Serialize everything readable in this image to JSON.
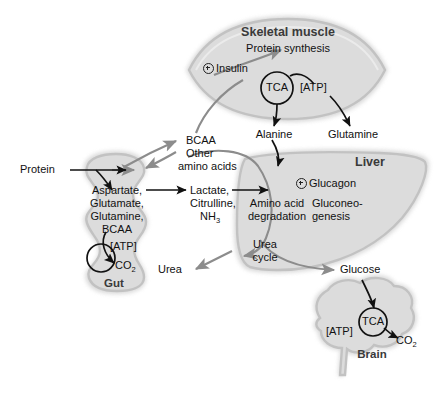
{
  "figure": {
    "type": "metabolic-pathway-diagram",
    "palette": {
      "organ_fill": "#dcdcdc",
      "organ_edge": "#bdbdbd",
      "organ_halo": "#d4d4d4",
      "black_arrow": "#111111",
      "gray_arrow": "#8c8c8c",
      "organ_label": "#3a3a3a",
      "text": "#111111",
      "background": "#ffffff"
    }
  },
  "organs": [
    {
      "id": "skeletal-muscle",
      "label": "Skeletal muscle",
      "shape": "spindle"
    },
    {
      "id": "gut",
      "label": "Gut",
      "shape": "wavy-tube"
    },
    {
      "id": "liver",
      "label": "Liver",
      "shape": "wedge"
    },
    {
      "id": "brain",
      "label": "Brain",
      "shape": "brain-silhouette"
    }
  ],
  "skeletal_muscle": {
    "title": "Skeletal muscle",
    "process": "Protein synthesis",
    "hormone": "Insulin",
    "hormone_effect": "+",
    "cycle": "TCA",
    "energy": "[ATP]",
    "outputs": [
      "Alanine",
      "Glutamine"
    ]
  },
  "gut": {
    "title": "Gut",
    "input": "Protein",
    "metabolites": [
      "Aspartate,",
      "Glutamate,",
      "Glutamine,",
      "BCAA"
    ],
    "energy": "[ATP]",
    "waste": "CO",
    "waste_sub": "2",
    "outputs": [
      "Lactate,",
      "Citrulline,",
      "NH"
    ],
    "outputs_sub": "3"
  },
  "liver": {
    "title": "Liver",
    "hormone": "Glucagon",
    "hormone_effect": "+",
    "processes": [
      "Amino acid degradation",
      "Gluconeo-genesis",
      "Urea cycle"
    ],
    "process_lines": {
      "degradation": [
        "Amino acid",
        "degradation"
      ],
      "gluconeogenesis": [
        "Gluconeo-",
        "genesis"
      ],
      "urea": [
        "Urea",
        "cycle"
      ]
    },
    "waste_output": "Urea",
    "product_output": "Glucose"
  },
  "brain": {
    "title": "Brain",
    "cycle": "TCA",
    "energy": "[ATP]",
    "waste": "CO",
    "waste_sub": "2",
    "input": "Glucose"
  },
  "shared_pool": {
    "lines": [
      "BCAA",
      "Other",
      "amino acids"
    ]
  },
  "edges": [
    {
      "from": "Protein",
      "to": "gut",
      "color": "black"
    },
    {
      "from": "Protein",
      "to": "Aspartate/Glutamate/Glutamine/BCAA",
      "color": "black"
    },
    {
      "from": "gut-metabolites",
      "to": "Lactate/Citrulline/NH3",
      "color": "black"
    },
    {
      "from": "gut-TCA",
      "to": "CO2",
      "color": "black"
    },
    {
      "from": "gut",
      "to": "BCAA/Other amino acids",
      "color": "gray",
      "bidirectional": true
    },
    {
      "from": "BCAA/Other amino acids",
      "to": "skeletal-muscle",
      "color": "gray"
    },
    {
      "from": "skeletal-muscle-TCA",
      "to": "Alanine",
      "color": "black"
    },
    {
      "from": "skeletal-muscle-ATP",
      "to": "Glutamine",
      "color": "black"
    },
    {
      "from": "Alanine",
      "to": "liver",
      "color": "black"
    },
    {
      "from": "Lactate/Citrulline/NH3",
      "to": "liver",
      "color": "black"
    },
    {
      "from": "liver-amino-acid-degradation",
      "to": "Urea cycle",
      "color": "gray"
    },
    {
      "from": "Urea cycle",
      "to": "Urea",
      "color": "gray"
    },
    {
      "from": "liver-gluconeogenesis",
      "to": "Glucose",
      "color": "gray"
    },
    {
      "from": "Glucose",
      "to": "brain-TCA",
      "color": "black"
    },
    {
      "from": "brain-TCA",
      "to": "CO2",
      "color": "black"
    },
    {
      "from": "Insulin",
      "to": "Protein synthesis",
      "color": "gray"
    }
  ]
}
